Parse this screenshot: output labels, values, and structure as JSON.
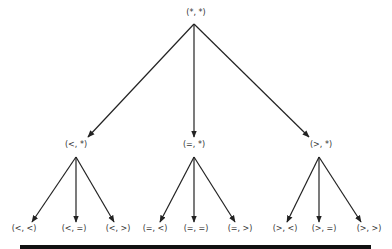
{
  "diagram": {
    "type": "tree",
    "colors": {
      "edge": "#222222",
      "label": "#333333",
      "bar": "#111111"
    },
    "root": {
      "label": "(*, *)",
      "x": 196,
      "y": 13
    },
    "level1": [
      {
        "label": "(<, *)",
        "x": 75,
        "y": 145
      },
      {
        "label": "(=, *)",
        "x": 193,
        "y": 145
      },
      {
        "label": "(>, *)",
        "x": 321,
        "y": 145
      }
    ],
    "level2": [
      {
        "label": "(<, <)",
        "x": 24,
        "y": 228,
        "parent": 0
      },
      {
        "label": "(<, =)",
        "x": 74,
        "y": 228,
        "parent": 0
      },
      {
        "label": "(<, >)",
        "x": 118,
        "y": 228,
        "parent": 0
      },
      {
        "label": "(=, <)",
        "x": 155,
        "y": 228,
        "parent": 1
      },
      {
        "label": "(=, =)",
        "x": 196,
        "y": 228,
        "parent": 1
      },
      {
        "label": "(=, >)",
        "x": 240,
        "y": 228,
        "parent": 1
      },
      {
        "label": "(>, <)",
        "x": 285,
        "y": 228,
        "parent": 2
      },
      {
        "label": "(>, =)",
        "x": 324,
        "y": 228,
        "parent": 2
      },
      {
        "label": "(>, >)",
        "x": 369,
        "y": 228,
        "parent": 2
      }
    ]
  }
}
